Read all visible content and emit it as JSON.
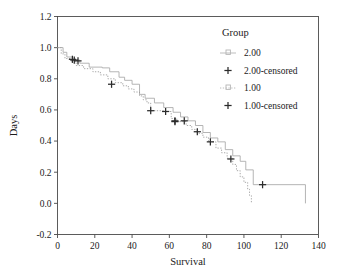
{
  "chart_data": {
    "type": "line",
    "subtype": "kaplan-meier-step",
    "title": "",
    "xlabel": "Survival",
    "ylabel": "Days",
    "xlim": [
      0,
      140
    ],
    "ylim": [
      -0.2,
      1.2
    ],
    "xticks": [
      0,
      20,
      40,
      60,
      80,
      100,
      120,
      140
    ],
    "yticks": [
      -0.2,
      0.0,
      0.2,
      0.4,
      0.6,
      0.8,
      1.0,
      1.2
    ],
    "xtick_labels": [
      "0",
      "20",
      "40",
      "60",
      "80",
      "100",
      "120",
      "140"
    ],
    "ytick_labels": [
      "-0.2",
      "0.0",
      "0.2",
      "0.4",
      "0.6",
      "0.8",
      "1.0",
      "1.2"
    ],
    "grid": false,
    "legend_position": "top-right",
    "legend_title": "Group",
    "series": [
      {
        "name": "2.00",
        "style": "step-solid-light",
        "color": "#a8a8a8",
        "points": [
          [
            0,
            1.0
          ],
          [
            3,
            1.0
          ],
          [
            3,
            0.97
          ],
          [
            5,
            0.97
          ],
          [
            5,
            0.94
          ],
          [
            8,
            0.94
          ],
          [
            8,
            0.92
          ],
          [
            12,
            0.92
          ],
          [
            12,
            0.9
          ],
          [
            17,
            0.9
          ],
          [
            17,
            0.875
          ],
          [
            24,
            0.875
          ],
          [
            24,
            0.87
          ],
          [
            28,
            0.87
          ],
          [
            28,
            0.845
          ],
          [
            33,
            0.845
          ],
          [
            33,
            0.81
          ],
          [
            36,
            0.81
          ],
          [
            36,
            0.79
          ],
          [
            40,
            0.79
          ],
          [
            40,
            0.765
          ],
          [
            44,
            0.765
          ],
          [
            44,
            0.7
          ],
          [
            47,
            0.7
          ],
          [
            47,
            0.675
          ],
          [
            52,
            0.675
          ],
          [
            52,
            0.645
          ],
          [
            57,
            0.645
          ],
          [
            57,
            0.615
          ],
          [
            62,
            0.615
          ],
          [
            62,
            0.585
          ],
          [
            66,
            0.585
          ],
          [
            66,
            0.555
          ],
          [
            70,
            0.555
          ],
          [
            70,
            0.53
          ],
          [
            74,
            0.53
          ],
          [
            74,
            0.5
          ],
          [
            78,
            0.5
          ],
          [
            78,
            0.455
          ],
          [
            82,
            0.455
          ],
          [
            82,
            0.42
          ],
          [
            86,
            0.42
          ],
          [
            86,
            0.395
          ],
          [
            90,
            0.395
          ],
          [
            90,
            0.345
          ],
          [
            94,
            0.345
          ],
          [
            94,
            0.305
          ],
          [
            98,
            0.305
          ],
          [
            98,
            0.27
          ],
          [
            101,
            0.27
          ],
          [
            101,
            0.215
          ],
          [
            105,
            0.215
          ],
          [
            105,
            0.12
          ],
          [
            133,
            0.12
          ],
          [
            133,
            0.0
          ]
        ],
        "censored": [
          [
            8,
            0.925
          ],
          [
            9,
            0.92
          ],
          [
            11,
            0.915
          ],
          [
            29,
            0.765
          ],
          [
            63,
            0.53
          ],
          [
            68,
            0.53
          ],
          [
            93,
            0.285
          ],
          [
            110,
            0.12
          ]
        ]
      },
      {
        "name": "1.00",
        "style": "step-dotted",
        "color": "#9a9a9a",
        "points": [
          [
            0,
            1.0
          ],
          [
            2,
            1.0
          ],
          [
            2,
            0.96
          ],
          [
            4,
            0.96
          ],
          [
            4,
            0.93
          ],
          [
            7,
            0.93
          ],
          [
            7,
            0.91
          ],
          [
            10,
            0.91
          ],
          [
            10,
            0.885
          ],
          [
            14,
            0.885
          ],
          [
            14,
            0.865
          ],
          [
            19,
            0.865
          ],
          [
            19,
            0.845
          ],
          [
            23,
            0.845
          ],
          [
            23,
            0.825
          ],
          [
            27,
            0.825
          ],
          [
            27,
            0.8
          ],
          [
            31,
            0.8
          ],
          [
            31,
            0.775
          ],
          [
            35,
            0.775
          ],
          [
            35,
            0.755
          ],
          [
            38,
            0.755
          ],
          [
            38,
            0.735
          ],
          [
            41,
            0.735
          ],
          [
            41,
            0.715
          ],
          [
            44,
            0.715
          ],
          [
            44,
            0.69
          ],
          [
            46,
            0.69
          ],
          [
            46,
            0.665
          ],
          [
            48,
            0.665
          ],
          [
            48,
            0.645
          ],
          [
            50,
            0.645
          ],
          [
            50,
            0.595
          ],
          [
            58,
            0.595
          ],
          [
            58,
            0.59
          ],
          [
            61,
            0.59
          ],
          [
            61,
            0.545
          ],
          [
            64,
            0.545
          ],
          [
            64,
            0.525
          ],
          [
            69,
            0.525
          ],
          [
            69,
            0.5
          ],
          [
            72,
            0.5
          ],
          [
            72,
            0.475
          ],
          [
            75,
            0.475
          ],
          [
            75,
            0.45
          ],
          [
            78,
            0.45
          ],
          [
            78,
            0.425
          ],
          [
            81,
            0.425
          ],
          [
            81,
            0.395
          ],
          [
            85,
            0.395
          ],
          [
            85,
            0.355
          ],
          [
            88,
            0.355
          ],
          [
            88,
            0.325
          ],
          [
            91,
            0.325
          ],
          [
            91,
            0.29
          ],
          [
            94,
            0.29
          ],
          [
            94,
            0.25
          ],
          [
            96,
            0.25
          ],
          [
            96,
            0.21
          ],
          [
            98,
            0.21
          ],
          [
            98,
            0.17
          ],
          [
            100,
            0.17
          ],
          [
            100,
            0.135
          ],
          [
            102,
            0.135
          ],
          [
            102,
            0.09
          ],
          [
            103,
            0.09
          ],
          [
            103,
            0.05
          ],
          [
            104,
            0.05
          ],
          [
            104,
            0.0
          ]
        ],
        "censored": [
          [
            50,
            0.595
          ],
          [
            58,
            0.59
          ],
          [
            63,
            0.525
          ],
          [
            75,
            0.46
          ],
          [
            82,
            0.395
          ]
        ]
      }
    ],
    "legend_entries": [
      {
        "label": "2.00",
        "marker": "line-square",
        "color": "#b5b5b5"
      },
      {
        "label": "2.00-censored",
        "marker": "plus",
        "color": "#333333"
      },
      {
        "label": "1.00",
        "marker": "line-square-dotted",
        "color": "#b5b5b5"
      },
      {
        "label": "1.00-censored",
        "marker": "plus",
        "color": "#333333"
      }
    ]
  },
  "axis": {
    "frame_color": "#4a4a4a",
    "text_color": "#1a1a1a"
  }
}
